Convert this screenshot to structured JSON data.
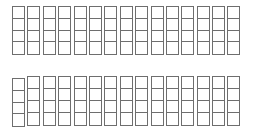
{
  "grids": [
    {
      "name": "top-grid",
      "columns": 15,
      "rows": 4
    },
    {
      "name": "bottom-grid",
      "columns": 15,
      "rows": 4,
      "first_column_offset": true
    }
  ],
  "colors": {
    "stroke": "#6e6e6e",
    "background": "#ffffff"
  }
}
